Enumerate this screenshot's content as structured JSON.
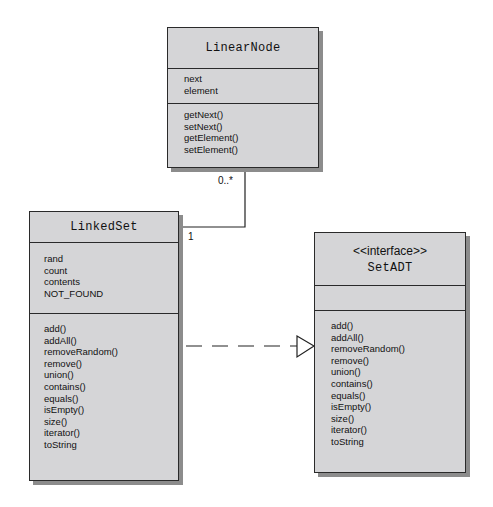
{
  "diagram": {
    "type": "UML class diagram",
    "classes": {
      "linear_node": {
        "name": "LinearNode",
        "attributes": [
          "next",
          "element"
        ],
        "methods": [
          "getNext()",
          "setNext()",
          "getElement()",
          "setElement()"
        ]
      },
      "linked_set": {
        "name": "LinkedSet",
        "attributes": [
          "rand",
          "count",
          "contents",
          "NOT_FOUND"
        ],
        "methods": [
          "add()",
          "addAll()",
          "removeRandom()",
          "remove()",
          "union()",
          "contains()",
          "equals()",
          "isEmpty()",
          "size()",
          "iterator()",
          "toString"
        ]
      },
      "set_adt": {
        "stereotype": "<<interface>>",
        "name": "SetADT",
        "attributes": [],
        "methods": [
          "add()",
          "addAll()",
          "removeRandom()",
          "remove()",
          "union()",
          "contains()",
          "equals()",
          "isEmpty()",
          "size()",
          "iterator()",
          "toString"
        ]
      }
    },
    "relationships": [
      {
        "kind": "association",
        "from": "LinkedSet",
        "to": "LinearNode",
        "from_multiplicity": "1",
        "to_multiplicity": "0..*"
      },
      {
        "kind": "realization",
        "from": "LinkedSet",
        "to": "SetADT"
      }
    ],
    "labels": {
      "multiplicity_many": "0..*",
      "multiplicity_one": "1"
    },
    "colors": {
      "box_fill": "#d5d5d7",
      "border": "#2a2a2a",
      "shadow": "#8c8c8c"
    }
  }
}
